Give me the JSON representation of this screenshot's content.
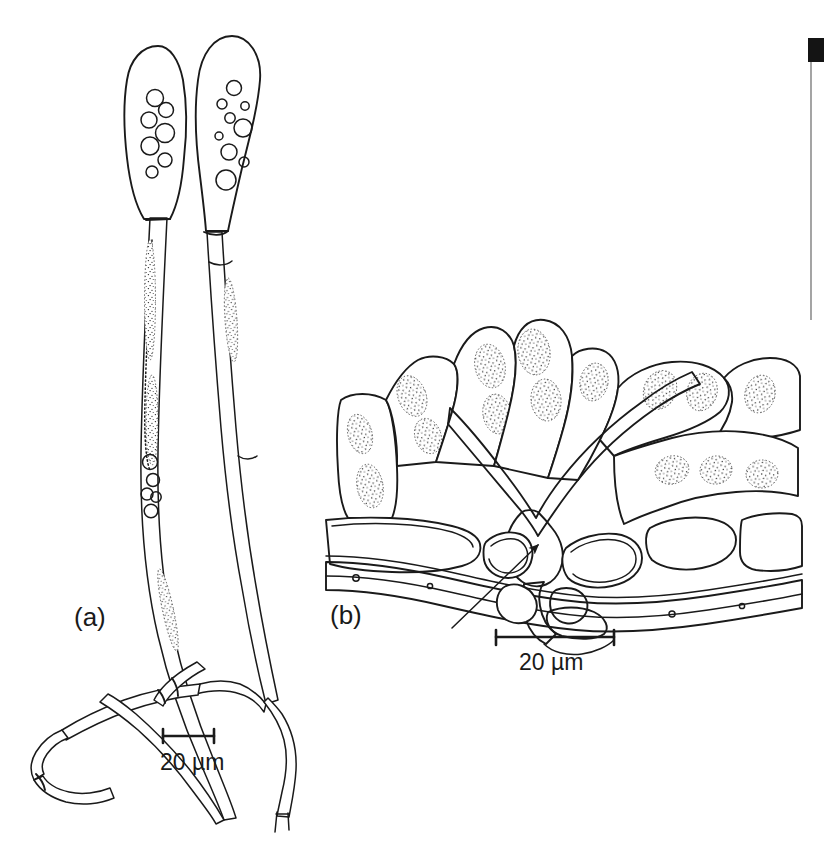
{
  "figure": {
    "kind": "scientific-line-drawing",
    "background_color": "#ffffff",
    "ink_color": "#1a1a1a",
    "panels": [
      {
        "id": "a",
        "label": "(a)",
        "subject": "Two clavate conidiophores with swollen stippled conidia and long slender branching stalks",
        "scale_bar": {
          "label": "20 µm",
          "pixel_length": 51
        }
      },
      {
        "id": "b",
        "label": "(b)",
        "subject": "Transverse section of host leaf tissue showing epidermal and mesophyll cells with a stippled fungal hypha penetrating between cells; arrow indicates the penetration site",
        "scale_bar": {
          "label": "20 µm",
          "pixel_length": 118
        },
        "annotation": {
          "type": "arrow",
          "points_to": "penetration-site"
        }
      }
    ]
  },
  "panel_a": {
    "label": "(a)",
    "scale_label": "20 µm"
  },
  "panel_b": {
    "label": "(b)",
    "scale_label": "20 µm"
  },
  "scan_artifacts": {
    "corner_block_color": "#141414",
    "edge_line_color": "#8e8e8e"
  }
}
